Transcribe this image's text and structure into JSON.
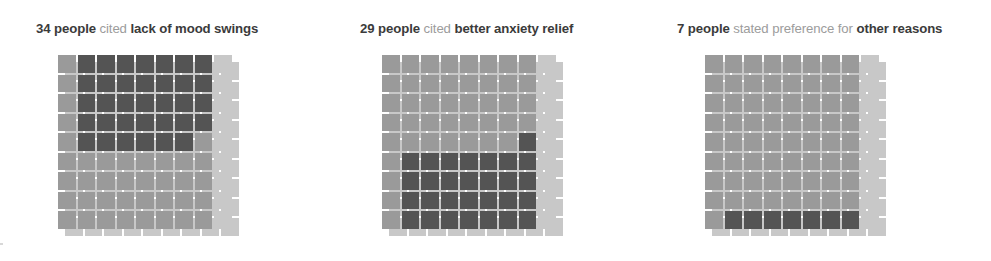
{
  "figure": {
    "width": 991,
    "height": 261,
    "background": "#ffffff"
  },
  "colors": {
    "highlight": "#545454",
    "base": "#9a9a9a",
    "shadow": "#c8c8c8",
    "gap": "#ffffff",
    "title_strong": "#3b3b3b",
    "title_muted": "#9c9c9c"
  },
  "panels": [
    {
      "id": "mood-swings",
      "left": 58,
      "title_left": 18,
      "title": {
        "count": "34 people",
        "verb": " cited ",
        "reason": "lack of mood swings"
      }
    },
    {
      "id": "anxiety-relief",
      "left": 382,
      "title_left": 18,
      "title": {
        "count": "29 people",
        "verb": " cited ",
        "reason": "better anxiety relief"
      }
    },
    {
      "id": "other-reasons",
      "left": 705,
      "title_left": 12,
      "title": {
        "count": "7 people",
        "verb": " stated preference for ",
        "reason": "other reasons"
      }
    }
  ],
  "chart_data": {
    "type": "bar",
    "chart_subtype": "waffle",
    "xlabel": "",
    "ylabel": "",
    "grid": {
      "rows": 9,
      "cols": 9,
      "total_cells": 81
    },
    "categories": [
      "lack of mood swings",
      "better anxiety relief",
      "other reasons"
    ],
    "values": [
      34,
      29,
      7
    ],
    "value_unit": "people",
    "series": [
      {
        "name": "highlighted (cited reason)",
        "values": [
          34,
          29,
          7
        ],
        "color": "#545454"
      },
      {
        "name": "remaining base squares",
        "values": [
          38,
          43,
          65
        ],
        "color": "#9a9a9a"
      }
    ],
    "legend": [
      "highlighted (cited reason)",
      "remaining base squares"
    ],
    "legend_position": "none",
    "panel_fill_maps": [
      {
        "category": "lack of mood swings",
        "highlight_count": 34,
        "highlight_cells_rowmajor": [
          [
            1,
            2
          ],
          [
            1,
            3
          ],
          [
            1,
            4
          ],
          [
            1,
            5
          ],
          [
            1,
            6
          ],
          [
            1,
            7
          ],
          [
            1,
            8
          ],
          [
            2,
            2
          ],
          [
            2,
            3
          ],
          [
            2,
            4
          ],
          [
            2,
            5
          ],
          [
            2,
            6
          ],
          [
            2,
            7
          ],
          [
            2,
            8
          ],
          [
            3,
            2
          ],
          [
            3,
            3
          ],
          [
            3,
            4
          ],
          [
            3,
            5
          ],
          [
            3,
            6
          ],
          [
            3,
            7
          ],
          [
            3,
            8
          ],
          [
            4,
            2
          ],
          [
            4,
            3
          ],
          [
            4,
            4
          ],
          [
            4,
            5
          ],
          [
            4,
            6
          ],
          [
            4,
            7
          ],
          [
            4,
            8
          ],
          [
            5,
            2
          ],
          [
            5,
            3
          ],
          [
            5,
            4
          ],
          [
            5,
            5
          ],
          [
            5,
            6
          ],
          [
            5,
            7
          ]
        ]
      },
      {
        "category": "better anxiety relief",
        "highlight_count": 29,
        "highlight_cells_rowmajor": [
          [
            5,
            8
          ],
          [
            6,
            2
          ],
          [
            6,
            3
          ],
          [
            6,
            4
          ],
          [
            6,
            5
          ],
          [
            6,
            6
          ],
          [
            6,
            7
          ],
          [
            6,
            8
          ],
          [
            7,
            2
          ],
          [
            7,
            3
          ],
          [
            7,
            4
          ],
          [
            7,
            5
          ],
          [
            7,
            6
          ],
          [
            7,
            7
          ],
          [
            7,
            8
          ],
          [
            8,
            2
          ],
          [
            8,
            3
          ],
          [
            8,
            4
          ],
          [
            8,
            5
          ],
          [
            8,
            6
          ],
          [
            8,
            7
          ],
          [
            8,
            8
          ],
          [
            9,
            2
          ],
          [
            9,
            3
          ],
          [
            9,
            4
          ],
          [
            9,
            5
          ],
          [
            9,
            6
          ],
          [
            9,
            7
          ],
          [
            9,
            8
          ]
        ]
      },
      {
        "category": "other reasons",
        "highlight_count": 7,
        "highlight_cells_rowmajor": [
          [
            9,
            2
          ],
          [
            9,
            3
          ],
          [
            9,
            4
          ],
          [
            9,
            5
          ],
          [
            9,
            6
          ],
          [
            9,
            7
          ],
          [
            9,
            8
          ]
        ]
      }
    ]
  }
}
